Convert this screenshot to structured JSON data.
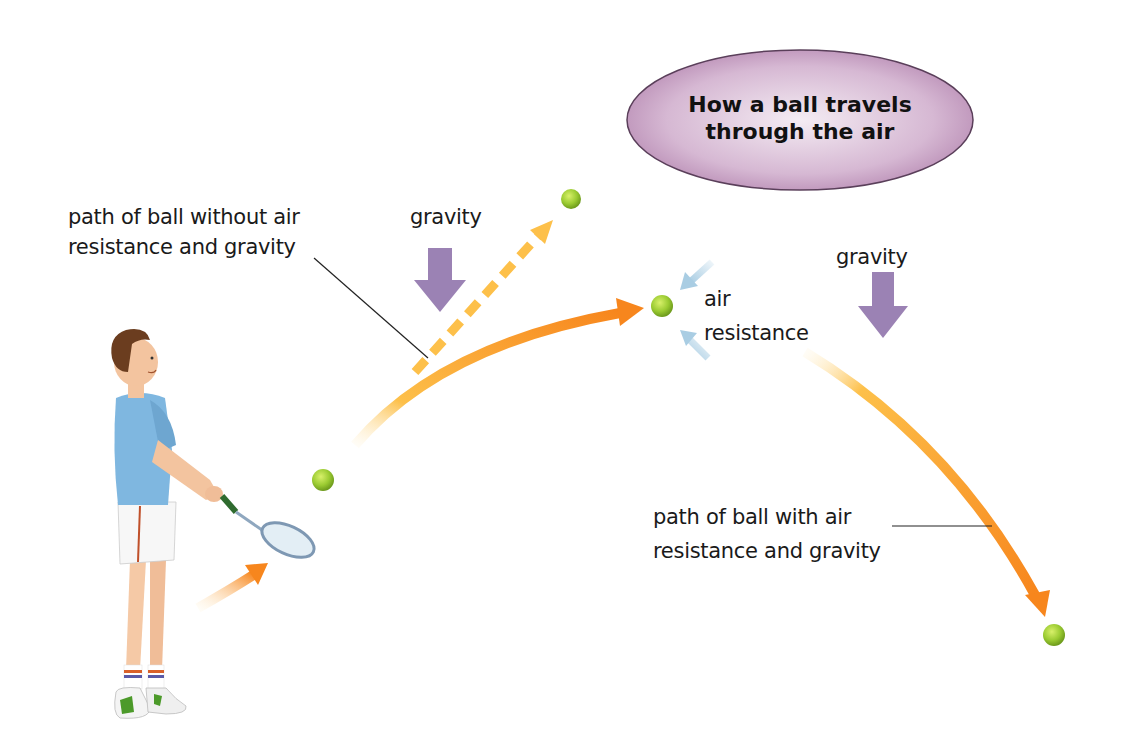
{
  "title": {
    "line1": "How a ball travels",
    "line2": "through the air",
    "bubble_color": "#c9a3c6"
  },
  "labels": {
    "without_air": {
      "line1": "path of ball without air",
      "line2": "resistance and gravity"
    },
    "gravity_left": "gravity",
    "gravity_right": "gravity",
    "air_resistance": {
      "line1": "air",
      "line2": "resistance"
    },
    "with_air": {
      "line1": "path of ball with air",
      "line2": "resistance and gravity"
    }
  },
  "colors": {
    "trajectory_orange": "#f7941d",
    "trajectory_yellow": "#fdc04a",
    "gravity_arrow": "#9b82b4",
    "air_arrow": "#a9cde3",
    "ball": "#9bcb32",
    "shirt": "#7fb7e0"
  },
  "elements": {
    "balls": [
      "ball-at-racket",
      "ball-without-air-end",
      "ball-at-peak",
      "ball-landing"
    ],
    "arrows": [
      "swing-arrow",
      "dashed-straight-path",
      "curved-path-rising",
      "curved-path-falling",
      "gravity-arrow-left",
      "gravity-arrow-right",
      "air-resistance-arrow-top",
      "air-resistance-arrow-bottom"
    ]
  }
}
